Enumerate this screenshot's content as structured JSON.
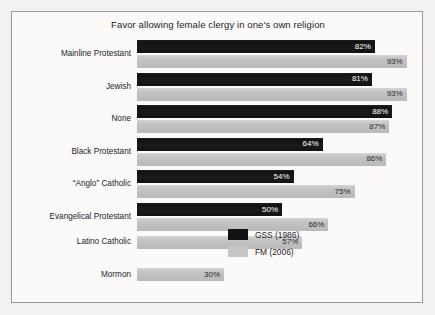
{
  "chart_data": {
    "type": "bar",
    "orientation": "horizontal",
    "title": "Favor allowing female clergy in one's own religion",
    "xlabel": "",
    "ylabel": "",
    "xlim": [
      0,
      100
    ],
    "grid": false,
    "legend_position": "bottom-right",
    "value_suffix": "%",
    "categories": [
      "Mainline Protestant",
      "Jewish",
      "None",
      "Black Protestant",
      "“Anglo” Catholic",
      "Evangelical Protestant",
      "Latino Catholic",
      "Mormon"
    ],
    "series": [
      {
        "name": "GSS (1986)",
        "color": "#121212",
        "values": [
          82,
          81,
          88,
          64,
          54,
          50,
          null,
          null
        ],
        "labels": [
          "82%",
          "81%",
          "88%",
          "64%",
          "54%",
          "50%",
          null,
          null
        ]
      },
      {
        "name": "FM (2006)",
        "color": "#c3c3c3",
        "values": [
          93,
          93,
          87,
          86,
          75,
          66,
          57,
          30
        ],
        "labels": [
          "93%",
          "93%",
          "87%",
          "86%",
          "75%",
          "66%",
          "57%",
          "30%"
        ]
      }
    ]
  },
  "legend": {
    "items": [
      {
        "label": "GSS (1986)",
        "swatch": "gss"
      },
      {
        "label": "FM (2006)",
        "swatch": "fm"
      }
    ]
  }
}
